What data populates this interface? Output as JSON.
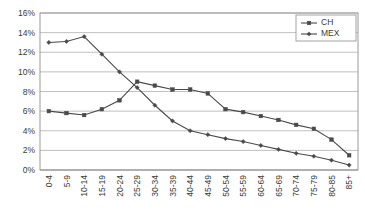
{
  "chart_data": {
    "type": "line",
    "title": "",
    "xlabel": "",
    "ylabel": "",
    "ylim": [
      0,
      16
    ],
    "ytick_labels": [
      "0%",
      "2%",
      "4%",
      "6%",
      "8%",
      "10%",
      "12%",
      "14%",
      "16%"
    ],
    "ytick_values": [
      0,
      2,
      4,
      6,
      8,
      10,
      12,
      14,
      16
    ],
    "grid": true,
    "legend_position": "top-right",
    "categories": [
      "0-4",
      "5-9",
      "10-14",
      "15-19",
      "20-24",
      "25-29",
      "30-34",
      "35-39",
      "40-44",
      "45-49",
      "50-54",
      "55-59",
      "60-64",
      "65-69",
      "70-74",
      "75-79",
      "80-85",
      "85+"
    ],
    "series": [
      {
        "name": "CH",
        "color": "#4a4a4a",
        "marker": "square",
        "values": [
          6.0,
          5.8,
          5.6,
          6.2,
          7.1,
          9.0,
          8.6,
          8.2,
          8.2,
          7.8,
          6.2,
          5.9,
          5.5,
          5.1,
          4.6,
          4.2,
          3.1,
          1.5
        ]
      },
      {
        "name": "MEX",
        "color": "#4a4a4a",
        "marker": "diamond",
        "values": [
          13.0,
          13.1,
          13.6,
          11.8,
          10.0,
          8.4,
          6.6,
          5.0,
          4.0,
          3.6,
          3.2,
          2.9,
          2.5,
          2.1,
          1.7,
          1.4,
          1.0,
          0.5
        ]
      }
    ]
  },
  "legend": {
    "items": [
      {
        "label": "CH"
      },
      {
        "label": "MEX"
      }
    ]
  }
}
